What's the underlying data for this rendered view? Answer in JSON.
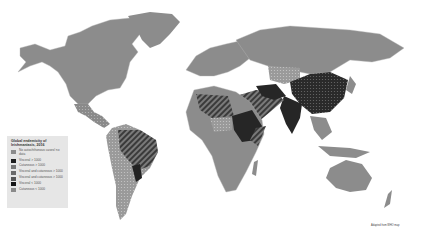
{
  "map": {
    "title": "Global endemicity of leishmaniasis, 2016",
    "colors": {
      "ocean": "#ffffff",
      "no_data": "#8c8c8c",
      "visceral": "#262626",
      "cutaneous": "#6e6e6e",
      "visceral_and_cutaneous": "#5a5a5a",
      "border": "#b5b5b5"
    },
    "legend": {
      "title": "Global endemicity of leishmaniasis, 2016",
      "items": [
        {
          "label": "No autochthonous cases/ no data",
          "color": "#8c8c8c",
          "pattern": "solid"
        },
        {
          "label": "Visceral > 1000",
          "color": "#1e1e1e",
          "pattern": "solid"
        },
        {
          "label": "Cutaneous > 1000",
          "color": "#777777",
          "pattern": "dots"
        },
        {
          "label": "Visceral and cutaneous > 1000",
          "color": "#6a6a6a",
          "pattern": "dots"
        },
        {
          "label": "Visceral and cutaneous > 1000",
          "color": "#555555",
          "pattern": "stripes"
        },
        {
          "label": "Visceral < 1000",
          "color": "#151515",
          "pattern": "solid"
        },
        {
          "label": "Cutaneous < 1000",
          "color": "#8a8a8a",
          "pattern": "dots"
        }
      ]
    },
    "credit": "Adapted from WHO map"
  }
}
